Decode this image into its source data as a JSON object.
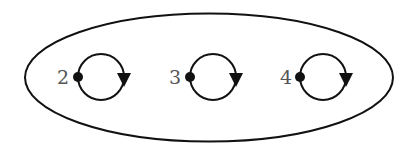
{
  "diagram": {
    "type": "state-diagram",
    "container": {
      "shape": "ellipse",
      "cx": 209,
      "cy": 77.5,
      "rx": 184,
      "ry": 64
    },
    "states": [
      {
        "label": "2",
        "dot": [
          78,
          77
        ],
        "loop_center": [
          101,
          77
        ],
        "label_pos": [
          57,
          84
        ]
      },
      {
        "label": "3",
        "dot": [
          190,
          77
        ],
        "loop_center": [
          213,
          77
        ],
        "label_pos": [
          169,
          84
        ]
      },
      {
        "label": "4",
        "dot": [
          300,
          77
        ],
        "loop_center": [
          323,
          77
        ],
        "label_pos": [
          280,
          84
        ]
      }
    ],
    "loop_radius": 23,
    "loop_direction": "clockwise",
    "colors": {
      "stroke": "#111111",
      "label": "#555555",
      "background": "#ffffff"
    }
  }
}
